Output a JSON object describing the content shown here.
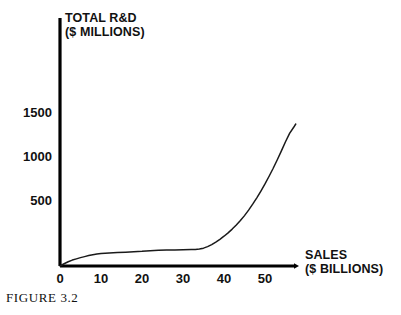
{
  "figure": {
    "caption": "FIGURE 3.2"
  },
  "chart_data": {
    "type": "line",
    "title": "",
    "ylabel_line1": "TOTAL R&D",
    "ylabel_line2": "($ MILLIONS)",
    "xlabel_line1": "SALES",
    "xlabel_line2": "($ BILLIONS)",
    "xlabel": "SALES ($ BILLIONS)",
    "ylabel": "TOTAL R&D ($ MILLIONS)",
    "grid": false,
    "legend": "none",
    "xticks": [
      0,
      10,
      20,
      30,
      40,
      50
    ],
    "xtick_labels": [
      "0",
      "10",
      "20",
      "30",
      "40",
      "50"
    ],
    "yticks": [
      500,
      1000,
      1500
    ],
    "ytick_labels": [
      "500",
      "1000",
      "1500"
    ],
    "xlim": [
      0,
      57.5
    ],
    "ylim": [
      0,
      1700
    ],
    "line_color": "#1a1a1a",
    "axis_color": "#000000",
    "series": [
      {
        "name": "Total R&D vs Sales",
        "x": [
          0,
          1,
          2,
          3,
          4,
          5,
          6,
          7,
          8,
          9,
          10,
          12,
          14,
          16,
          18,
          20,
          22,
          24,
          26,
          28,
          30,
          32,
          33,
          34,
          35,
          36,
          37,
          38,
          39,
          40,
          41,
          42,
          43,
          44,
          45,
          46,
          47,
          48,
          49,
          50,
          51,
          52,
          53,
          54,
          55,
          56,
          57,
          57.5
        ],
        "y": [
          0,
          22,
          42,
          58,
          70,
          82,
          92,
          102,
          110,
          117,
          122,
          128,
          132,
          136,
          140,
          144,
          150,
          154,
          156,
          158,
          160,
          162,
          162,
          166,
          175,
          190,
          210,
          235,
          262,
          292,
          325,
          362,
          402,
          446,
          494,
          548,
          606,
          668,
          735,
          805,
          880,
          958,
          1042,
          1128,
          1218,
          1300,
          1360,
          1392
        ]
      }
    ]
  }
}
